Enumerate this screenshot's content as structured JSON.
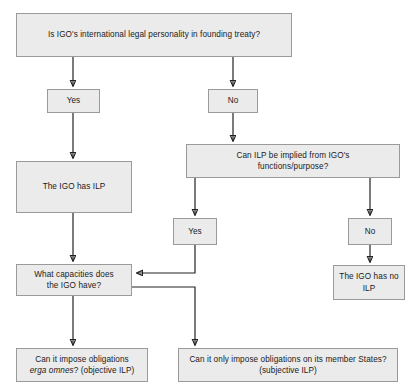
{
  "diagram": {
    "style": {
      "node_fill": "#ebebeb",
      "node_border": "#9a9a9a",
      "connector_color": "#222222",
      "text_color": "#1a1a1a",
      "background": "#ffffff"
    },
    "nodes": [
      {
        "id": "q-founding-treaty",
        "label": "Is IGO's international legal personality in founding treaty?",
        "role": "question"
      },
      {
        "id": "yes-treaty",
        "label": "Yes",
        "role": "branch-label"
      },
      {
        "id": "no-treaty",
        "label": "No",
        "role": "branch-label"
      },
      {
        "id": "q-implied",
        "label": "Can ILP be implied from IGO's functions/purpose?",
        "label_line1": "Can ILP be implied from IGO's",
        "label_line2": "functions/purpose?",
        "role": "question"
      },
      {
        "id": "has-ilp",
        "label": "The IGO has ILP",
        "role": "outcome"
      },
      {
        "id": "yes-implied",
        "label": "Yes",
        "role": "branch-label"
      },
      {
        "id": "no-implied",
        "label": "No",
        "role": "branch-label"
      },
      {
        "id": "has-no-ilp",
        "label": "The IGO has no ILP",
        "label_line1": "The IGO has no",
        "label_line2": "ILP",
        "role": "outcome"
      },
      {
        "id": "q-capacities",
        "label": "What capacities does the IGO have?",
        "label_line1": "What capacities does",
        "label_line2": "the IGO have?",
        "role": "question"
      },
      {
        "id": "objective-ilp",
        "label": "Can it impose obligations erga omnes? (objective ILP)",
        "label_line1": "Can it impose obligations",
        "label_line2_italic": "erga omnes",
        "label_line2_rest": "? (objective ILP)",
        "role": "outcome"
      },
      {
        "id": "subjective-ilp",
        "label": "Can it only impose obligations on its member States? (subjective ILP)",
        "label_line1": "Can it only impose obligations on its member States?",
        "label_line2": "(subjective ILP)",
        "role": "outcome"
      }
    ],
    "edges": [
      {
        "from": "q-founding-treaty",
        "to": "yes-treaty"
      },
      {
        "from": "q-founding-treaty",
        "to": "no-treaty"
      },
      {
        "from": "yes-treaty",
        "to": "has-ilp"
      },
      {
        "from": "no-treaty",
        "to": "q-implied"
      },
      {
        "from": "q-implied",
        "to": "yes-implied"
      },
      {
        "from": "q-implied",
        "to": "no-implied"
      },
      {
        "from": "yes-implied",
        "to": "q-capacities"
      },
      {
        "from": "no-implied",
        "to": "has-no-ilp"
      },
      {
        "from": "has-ilp",
        "to": "q-capacities"
      },
      {
        "from": "q-capacities",
        "to": "objective-ilp"
      },
      {
        "from": "q-capacities",
        "to": "subjective-ilp"
      }
    ]
  }
}
